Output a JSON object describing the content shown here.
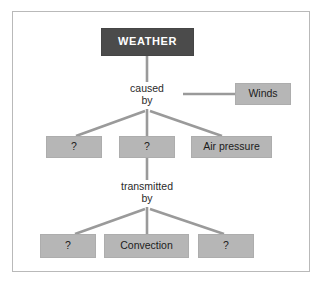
{
  "diagram": {
    "type": "hierarchy-concept-map",
    "title_node": "WEATHER",
    "colors": {
      "root_box_fill": "#4b4b4b",
      "root_box_text": "#ffffff",
      "node_box_fill": "#b6b6b6",
      "node_box_text": "#1c1c1c",
      "connector": "#9a9a9a",
      "frame_border": "#b9b9b9",
      "background": "#ffffff"
    },
    "nodes": {
      "root": {
        "label": "WEATHER"
      },
      "caused_by": {
        "label_line1": "caused",
        "label_line2": "by"
      },
      "winds": {
        "label": "Winds"
      },
      "cause_1": {
        "label": "?"
      },
      "cause_2": {
        "label": "?"
      },
      "cause_3": {
        "label": "Air pressure"
      },
      "transmitted_by": {
        "label_line1": "transmitted",
        "label_line2": "by"
      },
      "transmit_1": {
        "label": "?"
      },
      "transmit_2": {
        "label": "Convection"
      },
      "transmit_3": {
        "label": "?"
      }
    },
    "edges": [
      {
        "from": "root",
        "to": "caused_by"
      },
      {
        "from": "caused_by",
        "to": "winds"
      },
      {
        "from": "caused_by",
        "to": "cause_1"
      },
      {
        "from": "caused_by",
        "to": "cause_2"
      },
      {
        "from": "caused_by",
        "to": "cause_3"
      },
      {
        "from": "cause_2",
        "to": "transmitted_by"
      },
      {
        "from": "transmitted_by",
        "to": "transmit_1"
      },
      {
        "from": "transmitted_by",
        "to": "transmit_2"
      },
      {
        "from": "transmitted_by",
        "to": "transmit_3"
      }
    ]
  }
}
